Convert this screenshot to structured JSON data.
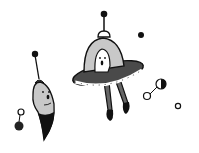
{
  "illustration": {
    "description": "Hand-drawn grayscale doodle of space aliens",
    "colors": {
      "background": "#ffffff",
      "outline": "#111111",
      "light_fill": "#c8c8c8",
      "dark_fill": "#4a4a4a",
      "black": "#111111"
    },
    "elements": [
      "ufo-with-alien",
      "bullet-alien",
      "floating-dot",
      "dumbbell-orbit",
      "small-ring",
      "pendant-orbit"
    ]
  }
}
